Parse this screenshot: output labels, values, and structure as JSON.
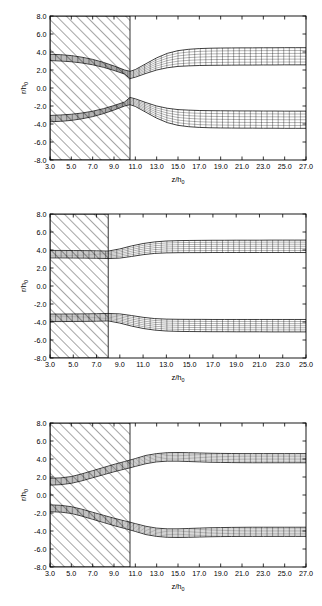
{
  "figure": {
    "title": "",
    "panel_count": 3
  },
  "axis": {
    "xlabel_main": "z/h",
    "xlabel_sub": "0",
    "ylabel_main": "r/h",
    "ylabel_sub": "0"
  },
  "chart_data": [
    {
      "type": "line",
      "panel_index": 1,
      "title": "",
      "xlabel": "z/h0",
      "ylabel": "r/h0",
      "xlim": [
        3.0,
        27.0
      ],
      "ylim": [
        -8.0,
        8.0
      ],
      "xticks": [
        3.0,
        5.0,
        7.0,
        9.0,
        11.0,
        13.0,
        15.0,
        17.0,
        19.0,
        21.0,
        23.0,
        25.0,
        27.0
      ],
      "yticks": [
        -8.0,
        -6.0,
        -4.0,
        -2.0,
        0.0,
        2.0,
        4.0,
        6.0,
        8.0
      ],
      "xtick_labels": [
        "3.0",
        "5.0",
        "7.0",
        "9.0",
        "11.0",
        "13.0",
        "15.0",
        "17.0",
        "19.0",
        "21.0",
        "23.0",
        "25.0",
        "27.0"
      ],
      "ytick_labels": [
        "-8.0",
        "-6.0",
        "-4.0",
        "-2.0",
        "0.0",
        "2.0",
        "4.0",
        "6.0",
        "8.0"
      ],
      "grid": false,
      "legend": "none",
      "hatched_region": {
        "x_start": 3.0,
        "x_end": 10.5,
        "y_start": -8.0,
        "y_end": 8.0,
        "pattern": "diagonal-45"
      },
      "series": [
        {
          "name": "upper-band-outer",
          "x": [
            3.0,
            4.0,
            5.0,
            6.0,
            7.0,
            8.0,
            9.0,
            10.0,
            10.5,
            11.0,
            12.0,
            13.0,
            14.0,
            15.0,
            16.0,
            17.0,
            18.0,
            19.0,
            20.0,
            21.0,
            22.0,
            23.0,
            24.0,
            25.0,
            26.0,
            27.0
          ],
          "values": [
            3.75,
            3.7,
            3.6,
            3.42,
            3.18,
            2.85,
            2.45,
            2.0,
            1.85,
            2.05,
            2.7,
            3.35,
            3.85,
            4.15,
            4.3,
            4.38,
            4.42,
            4.44,
            4.45,
            4.46,
            4.46,
            4.47,
            4.47,
            4.48,
            4.48,
            4.48
          ]
        },
        {
          "name": "upper-band-inner",
          "x": [
            3.0,
            4.0,
            5.0,
            6.0,
            7.0,
            8.0,
            9.0,
            10.0,
            10.5,
            11.0,
            12.0,
            13.0,
            14.0,
            15.0,
            16.0,
            17.0,
            18.0,
            19.0,
            20.0,
            21.0,
            22.0,
            23.0,
            24.0,
            25.0,
            26.0,
            27.0
          ],
          "values": [
            3.05,
            3.0,
            2.92,
            2.78,
            2.58,
            2.3,
            1.95,
            1.55,
            1.05,
            1.2,
            1.62,
            2.0,
            2.25,
            2.4,
            2.46,
            2.5,
            2.52,
            2.53,
            2.54,
            2.55,
            2.55,
            2.56,
            2.56,
            2.57,
            2.57,
            2.57
          ]
        },
        {
          "name": "lower-band-inner",
          "x": [
            3.0,
            4.0,
            5.0,
            6.0,
            7.0,
            8.0,
            9.0,
            10.0,
            10.5,
            11.0,
            12.0,
            13.0,
            14.0,
            15.0,
            16.0,
            17.0,
            18.0,
            19.0,
            20.0,
            21.0,
            22.0,
            23.0,
            24.0,
            25.0,
            26.0,
            27.0
          ],
          "values": [
            -3.05,
            -3.0,
            -2.92,
            -2.78,
            -2.58,
            -2.3,
            -1.95,
            -1.55,
            -1.05,
            -1.2,
            -1.62,
            -2.0,
            -2.25,
            -2.4,
            -2.46,
            -2.5,
            -2.52,
            -2.53,
            -2.54,
            -2.55,
            -2.55,
            -2.56,
            -2.56,
            -2.57,
            -2.57,
            -2.57
          ]
        },
        {
          "name": "lower-band-outer",
          "x": [
            3.0,
            4.0,
            5.0,
            6.0,
            7.0,
            8.0,
            9.0,
            10.0,
            10.5,
            11.0,
            12.0,
            13.0,
            14.0,
            15.0,
            16.0,
            17.0,
            18.0,
            19.0,
            20.0,
            21.0,
            22.0,
            23.0,
            24.0,
            25.0,
            26.0,
            27.0
          ],
          "values": [
            -3.75,
            -3.7,
            -3.6,
            -3.42,
            -3.18,
            -2.85,
            -2.45,
            -2.0,
            -1.85,
            -2.05,
            -2.7,
            -3.35,
            -3.85,
            -4.15,
            -4.3,
            -4.38,
            -4.42,
            -4.44,
            -4.45,
            -4.46,
            -4.46,
            -4.47,
            -4.47,
            -4.48,
            -4.48,
            -4.48
          ]
        }
      ]
    },
    {
      "type": "line",
      "panel_index": 2,
      "title": "",
      "xlabel": "z/h0",
      "ylabel": "r/h0",
      "xlim": [
        3.0,
        25.0
      ],
      "ylim": [
        -8.0,
        8.0
      ],
      "xticks": [
        3.0,
        5.0,
        7.0,
        9.0,
        11.0,
        13.0,
        15.0,
        17.0,
        19.0,
        21.0,
        23.0,
        25.0
      ],
      "yticks": [
        -8.0,
        -6.0,
        -4.0,
        -2.0,
        0.0,
        2.0,
        4.0,
        6.0,
        8.0
      ],
      "xtick_labels": [
        "3.0",
        "5.0",
        "7.0",
        "9.0",
        "11.0",
        "13.0",
        "15.0",
        "17.0",
        "19.0",
        "21.0",
        "23.0",
        "25.0"
      ],
      "ytick_labels": [
        "-8.0",
        "-6.0",
        "-4.0",
        "-2.0",
        "0.0",
        "2.0",
        "4.0",
        "6.0",
        "8.0"
      ],
      "grid": false,
      "legend": "none",
      "hatched_region": {
        "x_start": 3.0,
        "x_end": 8.0,
        "y_start": -8.0,
        "y_end": 8.0,
        "pattern": "diagonal-45"
      },
      "series": [
        {
          "name": "upper-band-outer",
          "x": [
            3.0,
            4.0,
            5.0,
            6.0,
            7.0,
            8.0,
            9.0,
            10.0,
            11.0,
            12.0,
            13.0,
            14.0,
            15.0,
            16.0,
            17.0,
            18.0,
            19.0,
            20.0,
            21.0,
            22.0,
            23.0,
            24.0,
            25.0
          ],
          "values": [
            3.95,
            3.95,
            3.94,
            3.93,
            3.91,
            3.88,
            4.12,
            4.45,
            4.72,
            4.9,
            5.0,
            5.04,
            5.06,
            5.07,
            5.08,
            5.08,
            5.09,
            5.09,
            5.09,
            5.1,
            5.1,
            5.1,
            5.1
          ]
        },
        {
          "name": "upper-band-inner",
          "x": [
            3.0,
            4.0,
            5.0,
            6.0,
            7.0,
            8.0,
            9.0,
            10.0,
            11.0,
            12.0,
            13.0,
            14.0,
            15.0,
            16.0,
            17.0,
            18.0,
            19.0,
            20.0,
            21.0,
            22.0,
            23.0,
            24.0,
            25.0
          ],
          "values": [
            3.12,
            3.12,
            3.11,
            3.1,
            3.08,
            3.05,
            3.1,
            3.28,
            3.48,
            3.62,
            3.68,
            3.7,
            3.71,
            3.71,
            3.72,
            3.72,
            3.72,
            3.72,
            3.72,
            3.72,
            3.72,
            3.72,
            3.72
          ]
        },
        {
          "name": "lower-band-inner",
          "x": [
            3.0,
            4.0,
            5.0,
            6.0,
            7.0,
            8.0,
            9.0,
            10.0,
            11.0,
            12.0,
            13.0,
            14.0,
            15.0,
            16.0,
            17.0,
            18.0,
            19.0,
            20.0,
            21.0,
            22.0,
            23.0,
            24.0,
            25.0
          ],
          "values": [
            -3.12,
            -3.12,
            -3.11,
            -3.1,
            -3.08,
            -3.05,
            -3.1,
            -3.28,
            -3.48,
            -3.62,
            -3.68,
            -3.7,
            -3.71,
            -3.71,
            -3.72,
            -3.72,
            -3.72,
            -3.72,
            -3.72,
            -3.72,
            -3.72,
            -3.72,
            -3.72
          ]
        },
        {
          "name": "lower-band-outer",
          "x": [
            3.0,
            4.0,
            5.0,
            6.0,
            7.0,
            8.0,
            9.0,
            10.0,
            11.0,
            12.0,
            13.0,
            14.0,
            15.0,
            16.0,
            17.0,
            18.0,
            19.0,
            20.0,
            21.0,
            22.0,
            23.0,
            24.0,
            25.0
          ],
          "values": [
            -3.95,
            -3.95,
            -3.94,
            -3.93,
            -3.91,
            -3.88,
            -4.12,
            -4.45,
            -4.72,
            -4.9,
            -5.0,
            -5.04,
            -5.06,
            -5.07,
            -5.08,
            -5.08,
            -5.09,
            -5.09,
            -5.09,
            -5.1,
            -5.1,
            -5.1,
            -5.1
          ]
        }
      ]
    },
    {
      "type": "line",
      "panel_index": 3,
      "title": "",
      "xlabel": "z/h0",
      "ylabel": "r/h0",
      "xlim": [
        3.0,
        27.0
      ],
      "ylim": [
        -8.0,
        8.0
      ],
      "xticks": [
        3.0,
        5.0,
        7.0,
        9.0,
        11.0,
        13.0,
        15.0,
        17.0,
        19.0,
        21.0,
        23.0,
        25.0,
        27.0
      ],
      "yticks": [
        -8.0,
        -6.0,
        -4.0,
        -2.0,
        0.0,
        2.0,
        4.0,
        6.0,
        8.0
      ],
      "xtick_labels": [
        "3.0",
        "5.0",
        "7.0",
        "9.0",
        "11.0",
        "13.0",
        "15.0",
        "17.0",
        "19.0",
        "21.0",
        "23.0",
        "25.0",
        "27.0"
      ],
      "ytick_labels": [
        "-8.0",
        "-6.0",
        "-4.0",
        "-2.0",
        "0.0",
        "2.0",
        "4.0",
        "6.0",
        "8.0"
      ],
      "grid": false,
      "legend": "none",
      "hatched_region": {
        "x_start": 3.0,
        "x_end": 10.5,
        "y_start": -8.0,
        "y_end": 8.0,
        "pattern": "diagonal-45"
      },
      "series": [
        {
          "name": "upper-band-outer",
          "x": [
            3.0,
            4.0,
            5.0,
            6.0,
            7.0,
            8.0,
            9.0,
            10.0,
            10.5,
            11.0,
            12.0,
            13.0,
            14.0,
            15.0,
            16.0,
            17.0,
            18.0,
            19.0,
            20.0,
            21.0,
            22.0,
            23.0,
            24.0,
            25.0,
            26.0,
            27.0
          ],
          "values": [
            1.85,
            1.9,
            2.05,
            2.35,
            2.7,
            3.05,
            3.4,
            3.72,
            3.88,
            4.05,
            4.4,
            4.6,
            4.7,
            4.72,
            4.7,
            4.67,
            4.64,
            4.62,
            4.61,
            4.6,
            4.6,
            4.6,
            4.6,
            4.6,
            4.6,
            4.6
          ]
        },
        {
          "name": "upper-band-inner",
          "x": [
            3.0,
            4.0,
            5.0,
            6.0,
            7.0,
            8.0,
            9.0,
            10.0,
            10.5,
            11.0,
            12.0,
            13.0,
            14.0,
            15.0,
            16.0,
            17.0,
            18.0,
            19.0,
            20.0,
            21.0,
            22.0,
            23.0,
            24.0,
            25.0,
            26.0,
            27.0
          ],
          "values": [
            1.1,
            1.15,
            1.3,
            1.58,
            1.92,
            2.25,
            2.58,
            2.88,
            3.02,
            3.18,
            3.48,
            3.68,
            3.76,
            3.76,
            3.72,
            3.68,
            3.64,
            3.62,
            3.6,
            3.59,
            3.58,
            3.58,
            3.58,
            3.58,
            3.58,
            3.58
          ]
        },
        {
          "name": "lower-band-inner",
          "x": [
            3.0,
            4.0,
            5.0,
            6.0,
            7.0,
            8.0,
            9.0,
            10.0,
            10.5,
            11.0,
            12.0,
            13.0,
            14.0,
            15.0,
            16.0,
            17.0,
            18.0,
            19.0,
            20.0,
            21.0,
            22.0,
            23.0,
            24.0,
            25.0,
            26.0,
            27.0
          ],
          "values": [
            -1.1,
            -1.15,
            -1.3,
            -1.58,
            -1.92,
            -2.25,
            -2.58,
            -2.88,
            -3.02,
            -3.18,
            -3.48,
            -3.68,
            -3.76,
            -3.76,
            -3.72,
            -3.68,
            -3.64,
            -3.62,
            -3.6,
            -3.59,
            -3.58,
            -3.58,
            -3.58,
            -3.58,
            -3.58,
            -3.58
          ]
        },
        {
          "name": "lower-band-outer",
          "x": [
            3.0,
            4.0,
            5.0,
            6.0,
            7.0,
            8.0,
            9.0,
            10.0,
            10.5,
            11.0,
            12.0,
            13.0,
            14.0,
            15.0,
            16.0,
            17.0,
            18.0,
            19.0,
            20.0,
            21.0,
            22.0,
            23.0,
            24.0,
            25.0,
            26.0,
            27.0
          ],
          "values": [
            -1.85,
            -1.9,
            -2.05,
            -2.35,
            -2.7,
            -3.05,
            -3.4,
            -3.72,
            -3.88,
            -4.05,
            -4.4,
            -4.6,
            -4.7,
            -4.72,
            -4.7,
            -4.67,
            -4.64,
            -4.62,
            -4.61,
            -4.6,
            -4.6,
            -4.6,
            -4.6,
            -4.6,
            -4.6,
            -4.6
          ]
        }
      ]
    }
  ]
}
